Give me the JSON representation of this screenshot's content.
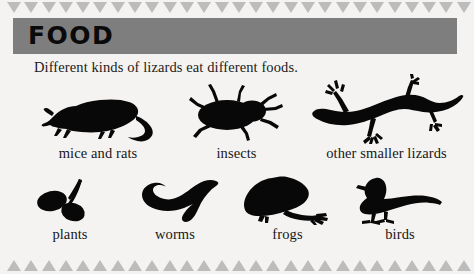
{
  "page": {
    "background_color": "#f4f3f1",
    "border": {
      "name": "triangle-border",
      "color": "#bcbcbc",
      "count": 30
    }
  },
  "banner": {
    "title": "FOOD",
    "background_color": "#7e7e7e",
    "text_color": "#0a0a0a"
  },
  "intro": {
    "text": "Different kinds of lizards eat different foods."
  },
  "rows": [
    {
      "name": "food-row-top",
      "items": [
        {
          "icon": "mouse-rat-silhouette-icon",
          "label": "mice and rats"
        },
        {
          "icon": "beetle-insect-silhouette-icon",
          "label": "insects"
        },
        {
          "icon": "lizard-gecko-silhouette-icon",
          "label": "other smaller lizards"
        }
      ]
    },
    {
      "name": "food-row-bottom",
      "items": [
        {
          "icon": "plant-leaves-silhouette-icon",
          "label": "plants"
        },
        {
          "icon": "worm-silhouette-icon",
          "label": "worms"
        },
        {
          "icon": "frog-silhouette-icon",
          "label": "frogs"
        },
        {
          "icon": "bird-silhouette-icon",
          "label": "birds"
        }
      ]
    }
  ]
}
